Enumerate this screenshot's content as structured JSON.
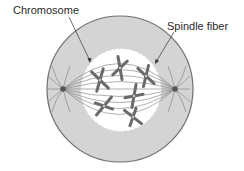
{
  "diagram": {
    "labels": {
      "chromosome": "Chromosome",
      "spindle_fiber": "Spindle fiber"
    },
    "colors": {
      "cytoplasm": "#d4d4d4",
      "cell_outline": "#6e6e6e",
      "nucleus_region": "#ffffff",
      "fibers": "#7a7a7a",
      "chromosome": "#6a6a6a",
      "centrosome": "#555555",
      "text": "#2a2a2a"
    }
  }
}
